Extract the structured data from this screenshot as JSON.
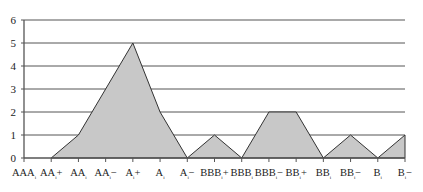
{
  "chart_data": {
    "type": "area",
    "title": "",
    "xlabel": "",
    "ylabel": "",
    "categories": [
      "AAA",
      "AA+",
      "AA",
      "AA−",
      "A+",
      "A",
      "A−",
      "BBB+",
      "BBB",
      "BBB−",
      "BB+",
      "BB",
      "BB−",
      "B",
      "B−"
    ],
    "category_subscript": "i",
    "values": [
      null,
      0,
      1,
      3,
      5,
      2,
      0,
      1,
      0,
      2,
      2,
      0,
      1,
      0,
      1
    ],
    "ylim": [
      0,
      6
    ],
    "yticks": [
      0,
      1,
      2,
      3,
      4,
      5,
      6
    ],
    "grid": true,
    "legend": null,
    "colors": {
      "fill": "#c8c8c8",
      "stroke": "#333333",
      "grid": "#555555",
      "axis": "#555555"
    }
  }
}
